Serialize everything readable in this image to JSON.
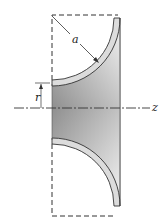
{
  "figure": {
    "labels": {
      "radius": "a",
      "inner_radius": "r",
      "axis": "z"
    },
    "colors": {
      "stroke": "#333333",
      "shade_dark": "#8f8f8f",
      "shade_light": "#f2f2f2",
      "wall_fill": "#d9d9d9"
    }
  }
}
